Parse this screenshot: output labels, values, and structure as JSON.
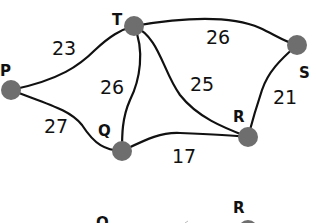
{
  "graph": {
    "nodes": [
      {
        "id": "P",
        "label": "P",
        "x": 11,
        "y": 90,
        "lx": 0,
        "ly": 76
      },
      {
        "id": "T",
        "label": "T",
        "x": 134,
        "y": 26,
        "lx": 112,
        "ly": 25
      },
      {
        "id": "S",
        "label": "S",
        "x": 297,
        "y": 45,
        "lx": 299,
        "ly": 78
      },
      {
        "id": "Q",
        "label": "Q",
        "x": 122,
        "y": 151,
        "lx": 98,
        "ly": 136
      },
      {
        "id": "R",
        "label": "R",
        "x": 248,
        "y": 137,
        "lx": 233,
        "ly": 122
      }
    ],
    "edges": [
      {
        "from": "P",
        "to": "T",
        "weight": "23",
        "wx": 52,
        "wy": 55
      },
      {
        "from": "T",
        "to": "S",
        "weight": "26",
        "wx": 206,
        "wy": 44
      },
      {
        "from": "T",
        "to": "Q",
        "weight": "26",
        "wx": 100,
        "wy": 94
      },
      {
        "from": "T",
        "to": "R",
        "weight": "25",
        "wx": 190,
        "wy": 91
      },
      {
        "from": "S",
        "to": "R",
        "weight": "21",
        "wx": 273,
        "wy": 104
      },
      {
        "from": "P",
        "to": "Q",
        "weight": "27",
        "wx": 44,
        "wy": 133
      },
      {
        "from": "Q",
        "to": "R",
        "weight": "17",
        "wx": 172,
        "wy": 163
      }
    ]
  },
  "second_graph_partial": {
    "labels": [
      {
        "label": "Q",
        "x": 96,
        "y": 226
      },
      {
        "label": "R",
        "x": 233,
        "y": 213
      }
    ]
  }
}
